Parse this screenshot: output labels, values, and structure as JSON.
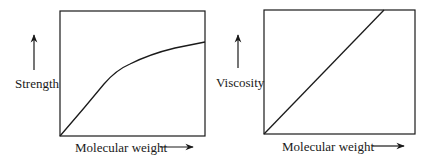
{
  "panels": [
    {
      "id": "strength",
      "y_label": "Strength",
      "x_label": "Molecular weight",
      "box": {
        "x": 60,
        "y": 11,
        "w": 145,
        "h": 125
      },
      "curve_path": "M60,136 L84,108 L104,84 Q116,70 130,64 Q150,54 175,48 Q190,45 205,42",
      "y_arrow": {
        "x": 34,
        "y1": 70,
        "y2": 35
      },
      "x_arrow": {
        "x1": 160,
        "x2": 193,
        "y": 147
      },
      "y_label_pos": {
        "left": 15,
        "top": 77
      },
      "x_label_pos": {
        "left": 75,
        "top": 141
      }
    },
    {
      "id": "viscosity",
      "y_label": "Viscosity",
      "x_label": "Molecular weight",
      "box": {
        "x": 264,
        "y": 10,
        "w": 151,
        "h": 124
      },
      "curve_path": "M264,134 L384,10",
      "y_arrow": {
        "x": 238,
        "y1": 68,
        "y2": 35
      },
      "x_arrow": {
        "x1": 372,
        "x2": 404,
        "y": 146
      },
      "y_label_pos": {
        "left": 216,
        "top": 76
      },
      "x_label_pos": {
        "left": 282,
        "top": 140
      }
    }
  ],
  "colors": {
    "stroke": "#1a1a1a",
    "background": "#ffffff"
  }
}
